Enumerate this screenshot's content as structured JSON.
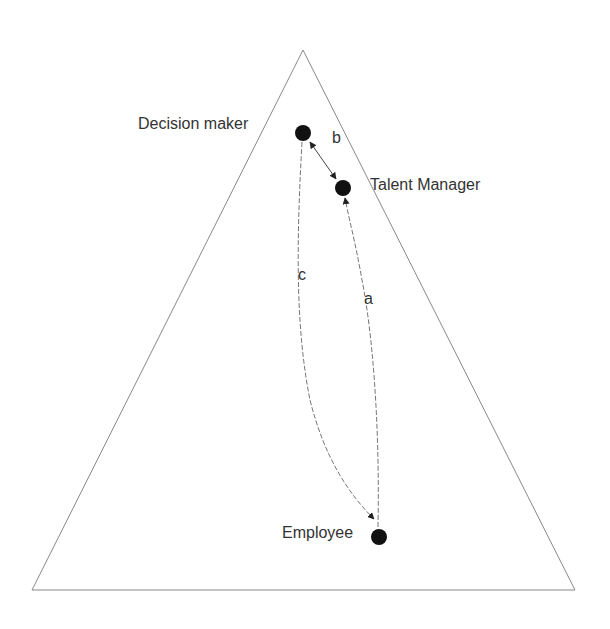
{
  "diagram": {
    "shape": "triangle",
    "nodes": [
      {
        "id": "decision_maker",
        "label": "Decision maker"
      },
      {
        "id": "talent_manager",
        "label": "Talent Manager"
      },
      {
        "id": "employee",
        "label": "Employee"
      }
    ],
    "edges": [
      {
        "label": "a",
        "from": "employee",
        "to": "talent_manager"
      },
      {
        "label": "b",
        "from": "decision_maker",
        "to": "talent_manager"
      },
      {
        "label": "c",
        "from": "decision_maker",
        "to": "employee"
      }
    ],
    "colors": {
      "line": "#777777",
      "node": "#111111",
      "text": "#333333"
    }
  }
}
